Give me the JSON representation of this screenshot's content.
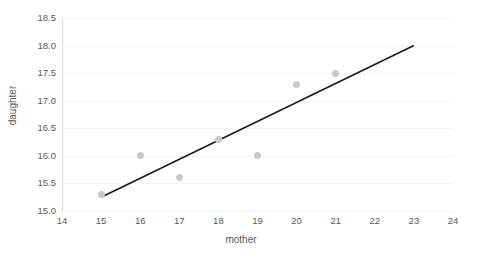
{
  "chart_data": {
    "type": "scatter",
    "title": "",
    "xlabel": "mother",
    "ylabel": "daughter",
    "xlim": [
      14,
      24
    ],
    "ylim": [
      15.0,
      18.5
    ],
    "xticks": [
      14,
      15,
      16,
      17,
      18,
      19,
      20,
      21,
      22,
      23,
      24
    ],
    "xtick_labels": [
      "14",
      "15",
      "16",
      "17",
      "18",
      "19",
      "20",
      "21",
      "22",
      "23",
      "24"
    ],
    "yticks": [
      15.0,
      15.5,
      16.0,
      16.5,
      17.0,
      17.5,
      18.0,
      18.5
    ],
    "ytick_labels": [
      "15.0",
      "15.5",
      "16.0",
      "16.5",
      "17.0",
      "17.5",
      "18.0",
      "18.5"
    ],
    "grid": true,
    "legend": false,
    "series": [
      {
        "name": "observations",
        "marker": "circle",
        "color": "#c9c9c9",
        "x": [
          15,
          16,
          17,
          18,
          19,
          20,
          21
        ],
        "y": [
          15.3,
          16.0,
          15.6,
          16.3,
          16.0,
          17.3,
          17.5
        ]
      }
    ],
    "trendline": {
      "name": "linear fit",
      "color": "#1a1a1a",
      "x": [
        15,
        23
      ],
      "y": [
        15.25,
        18.0
      ]
    }
  }
}
